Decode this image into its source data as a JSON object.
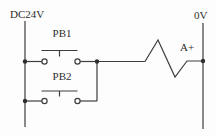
{
  "diagram": {
    "power_rails": {
      "left_label": "DC24V",
      "right_label": "0V"
    },
    "push_buttons": [
      {
        "label": "PB1"
      },
      {
        "label": "PB2"
      }
    ],
    "solenoid": {
      "label": "A+"
    },
    "colors": {
      "line": "#3d3d3d",
      "text": "#2e2e2e",
      "background": "#fdfdfd"
    }
  }
}
